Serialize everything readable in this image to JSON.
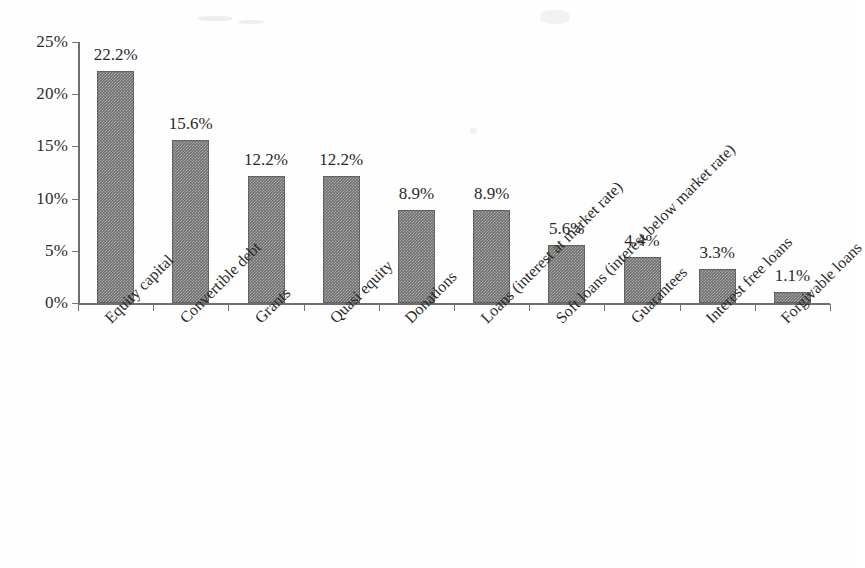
{
  "chart_data": {
    "type": "bar",
    "title": "",
    "subtitle": "",
    "xlabel": "",
    "ylabel": "",
    "ylim": [
      0,
      25
    ],
    "ytick_values": [
      0,
      5,
      10,
      15,
      20,
      25
    ],
    "ytick_labels": [
      "0%",
      "5%",
      "10%",
      "15%",
      "20%",
      "25%"
    ],
    "grid": false,
    "legend": false,
    "legend_position": "none",
    "bar_color": "#6e6e6e",
    "categories": [
      "Equity capital",
      "Convertible debt",
      "Grants",
      "Quasi equity",
      "Donations",
      "Loans (interest at market rate)",
      "Soft loans (interest below market rate)",
      "Guarantees",
      "Interest free loans",
      "Forgivable loans"
    ],
    "values": [
      22.2,
      15.6,
      12.2,
      12.2,
      8.9,
      8.9,
      5.6,
      4.4,
      3.3,
      1.1
    ],
    "value_labels": [
      "22.2%",
      "15.6%",
      "12.2%",
      "12.2%",
      "8.9%",
      "8.9%",
      "5.6%",
      "4.4%",
      "3.3%",
      "1.1%"
    ]
  }
}
